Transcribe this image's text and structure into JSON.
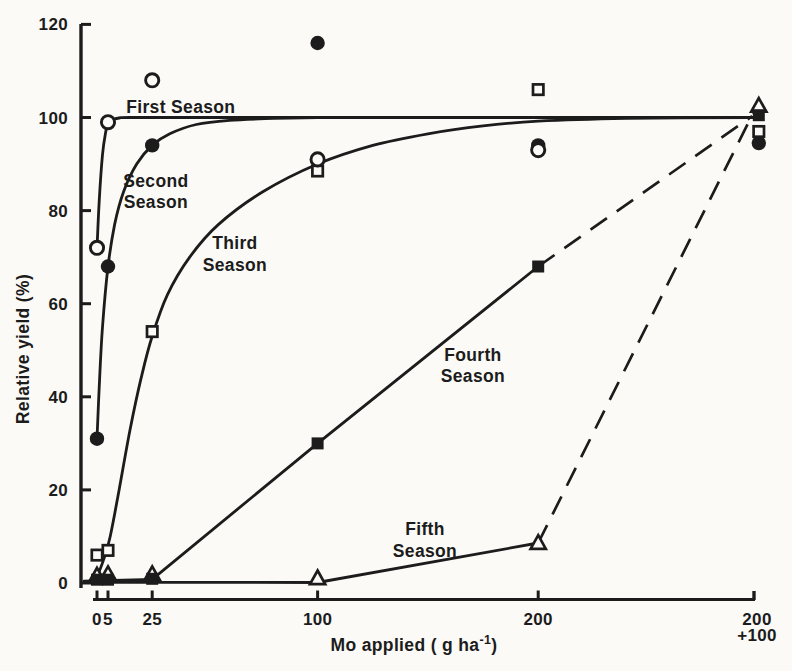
{
  "figure": {
    "background": "#fbfaf7",
    "ink": "#1c1c1c"
  },
  "chart_data": {
    "type": "scatter",
    "title": "",
    "ylabel": "Relative yield (%)",
    "xlabel_parts": {
      "pre": "Mo applied ( g ha",
      "sup": "-1",
      "post": ")"
    },
    "y_ticks": [
      0,
      20,
      40,
      60,
      80,
      100,
      120
    ],
    "y_range": [
      0,
      120
    ],
    "x_ticks": [
      {
        "value": 0,
        "lines": [
          "0"
        ]
      },
      {
        "value": 5,
        "lines": [
          "5"
        ]
      },
      {
        "value": 25,
        "lines": [
          "25"
        ]
      },
      {
        "value": 100,
        "lines": [
          "100"
        ]
      },
      {
        "value": 200,
        "lines": [
          "200"
        ]
      },
      {
        "value": 300,
        "lines": [
          "200",
          "+100"
        ]
      }
    ],
    "series": [
      {
        "name": "First Season",
        "marker": "circle-open",
        "line": "solid",
        "curve_style": "smooth",
        "points": [
          [
            0,
            72
          ],
          [
            5,
            99
          ],
          [
            25,
            108
          ],
          [
            100,
            91
          ],
          [
            200,
            93
          ]
        ],
        "curve": [
          [
            0,
            72
          ],
          [
            1,
            82
          ],
          [
            2.5,
            92
          ],
          [
            4,
            97
          ],
          [
            5,
            98.7
          ],
          [
            7,
            99.5
          ],
          [
            10,
            99.9
          ],
          [
            15,
            100
          ],
          [
            50,
            100
          ],
          [
            150,
            100
          ],
          [
            297,
            100
          ]
        ],
        "label": {
          "lines": [
            "First Season"
          ],
          "x": 38,
          "y": 102.3
        }
      },
      {
        "name": "Second Season",
        "marker": "circle-filled",
        "line": "solid",
        "curve_style": "smooth",
        "points": [
          [
            0,
            31
          ],
          [
            5,
            68
          ],
          [
            25,
            94
          ],
          [
            100,
            116
          ],
          [
            200,
            94
          ],
          [
            300,
            94.5
          ]
        ],
        "curve": [
          [
            0,
            31
          ],
          [
            1,
            42
          ],
          [
            2.5,
            55
          ],
          [
            5,
            68
          ],
          [
            8,
            77
          ],
          [
            12,
            84
          ],
          [
            18,
            90
          ],
          [
            25,
            94
          ],
          [
            33,
            96.5
          ],
          [
            45,
            98.5
          ],
          [
            60,
            99.4
          ],
          [
            80,
            99.8
          ],
          [
            100,
            100
          ]
        ],
        "label": {
          "lines": [
            "Second",
            "Season"
          ],
          "x": 26.7,
          "y": 86.4
        }
      },
      {
        "name": "Third Season",
        "marker": "square-open",
        "line": "solid",
        "curve_style": "smooth",
        "points": [
          [
            0,
            6
          ],
          [
            5,
            7
          ],
          [
            25,
            54
          ],
          [
            100,
            88.5
          ],
          [
            200,
            106
          ],
          [
            300,
            97
          ]
        ],
        "curve": [
          [
            1,
            2.5
          ],
          [
            3,
            5
          ],
          [
            6,
            10
          ],
          [
            10,
            20
          ],
          [
            15,
            33
          ],
          [
            20,
            44
          ],
          [
            25,
            53
          ],
          [
            32,
            62
          ],
          [
            42,
            70
          ],
          [
            55,
            77
          ],
          [
            75,
            84
          ],
          [
            100,
            90
          ],
          [
            125,
            94
          ],
          [
            150,
            96.5
          ],
          [
            175,
            98.2
          ],
          [
            200,
            99.2
          ],
          [
            240,
            99.8
          ],
          [
            297,
            100
          ]
        ],
        "label": {
          "lines": [
            "Third",
            "Season"
          ],
          "x": 62.5,
          "y": 73
        }
      },
      {
        "name": "Fourth Season",
        "marker": "square-filled",
        "line": "solid-then-dashed",
        "curve_style": "straight",
        "points": [
          [
            0,
            0.7
          ],
          [
            5,
            0.7
          ],
          [
            25,
            0.9
          ],
          [
            100,
            30
          ],
          [
            200,
            68
          ],
          [
            300,
            100.5
          ]
        ],
        "curve": [
          [
            -5.9,
            0.4
          ],
          [
            25,
            0.8
          ],
          [
            100,
            30
          ],
          [
            200,
            68
          ]
        ],
        "curve_dashed": [
          [
            200,
            68
          ],
          [
            297,
            100.3
          ]
        ],
        "label": {
          "lines": [
            "Fourth",
            "Season"
          ],
          "x": 170.4,
          "y": 49
        }
      },
      {
        "name": "Fifth Season",
        "marker": "triangle-open",
        "line": "solid-then-dashed",
        "curve_style": "straight",
        "points": [
          [
            0,
            1.6
          ],
          [
            5,
            1.9
          ],
          [
            25,
            1.9
          ],
          [
            100,
            1
          ],
          [
            200,
            8.6
          ],
          [
            300,
            102.5
          ]
        ],
        "curve": [
          [
            -5.9,
            0.15
          ],
          [
            100,
            0.1
          ],
          [
            200,
            8.6
          ]
        ],
        "curve_dashed": [
          [
            200,
            8.6
          ],
          [
            297.5,
            101
          ]
        ],
        "label": {
          "lines": [
            "Fifth",
            "Season"
          ],
          "x": 148.7,
          "y": 11.6
        }
      }
    ]
  }
}
